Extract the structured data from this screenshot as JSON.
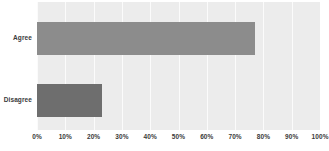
{
  "chart_data": {
    "type": "bar",
    "orientation": "horizontal",
    "title": "",
    "subtitle": "",
    "xlabel": "",
    "ylabel": "",
    "categories": [
      "Agree",
      "Disagree"
    ],
    "values": [
      77,
      23
    ],
    "value_suffix": "%",
    "xlim": [
      0,
      100
    ],
    "xticks": [
      0,
      10,
      20,
      30,
      40,
      50,
      60,
      70,
      80,
      90,
      100
    ],
    "xticklabels": [
      "0%",
      "10%",
      "20%",
      "30%",
      "40%",
      "50%",
      "60%",
      "70%",
      "80%",
      "90%",
      "100%"
    ],
    "grid": true,
    "grid_axis": "x",
    "legend": false,
    "legend_position": "none",
    "bar_colors": [
      "#8c8c8c",
      "#6e6e6e"
    ],
    "plot_background": "#ececec",
    "gridline_color": "#fbfbfb",
    "label_color": "#3a3a3a",
    "figure_background": "#ffffff"
  }
}
